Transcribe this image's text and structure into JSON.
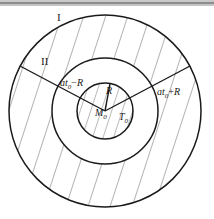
{
  "figure": {
    "name": "concentric-circles-hatched-diagram",
    "type": "geometric-diagram",
    "background_color": "#ffffff",
    "stroke_color": "#1a1a1a",
    "hatch_color": "#555555",
    "scan_artifact_color": "#9a9a9a"
  },
  "geometry": {
    "center": {
      "x": 105,
      "y": 111,
      "label_point": "M0"
    },
    "circles": [
      {
        "name": "outer-circle",
        "radius": 96,
        "stroke_width": 1.4,
        "fill": "none"
      },
      {
        "name": "middle-circle",
        "radius": 53,
        "stroke_width": 1.4,
        "fill": "none"
      },
      {
        "name": "inner-circle",
        "radius": 28,
        "stroke_width": 1.4,
        "fill": "none"
      }
    ],
    "regions": [
      {
        "name": "outer-annulus",
        "hatch": "sparse",
        "hatch_spacing": 21,
        "hatch_angle_deg": 72
      },
      {
        "name": "middle-annulus",
        "hatch": "none",
        "fill": "white"
      },
      {
        "name": "inner-disc",
        "hatch": "dense",
        "hatch_spacing": 10,
        "hatch_angle_deg": 72
      }
    ],
    "radii_lines": [
      {
        "name": "radius-line-upper-left",
        "from": "center",
        "angle_deg": 152,
        "length": 96
      },
      {
        "name": "radius-line-upper-right",
        "from": "center",
        "angle_deg": 28,
        "length": 96
      },
      {
        "name": "radius-line-short-up",
        "from": "center",
        "angle_deg": 100,
        "length": 28
      }
    ]
  },
  "labels": {
    "region_one": {
      "text": "I",
      "x": 57,
      "y": 18
    },
    "region_two": {
      "text": "II",
      "x": 42,
      "y": 62
    },
    "radius_inner": {
      "base": "R",
      "x": 107,
      "y": 92
    },
    "center_mass": {
      "base": "M",
      "sub": "0",
      "x": 97,
      "y": 113
    },
    "time_label": {
      "base": "T",
      "sub": "0",
      "x": 120,
      "y": 117
    },
    "left_expression": {
      "base": "at",
      "sub": "0",
      "op": "−",
      "tail": "R",
      "x": 61,
      "y": 84
    },
    "right_expression": {
      "base": "at",
      "sub": "0",
      "op": "+",
      "tail": "R",
      "x": 158,
      "y": 93
    }
  },
  "scan_artifacts": [
    {
      "name": "top-scan-bar-light",
      "y": 0,
      "height": 2,
      "color": "#c9c9c9"
    },
    {
      "name": "top-scan-bar-dark",
      "y": 2,
      "height": 2,
      "color": "#8d8d8d"
    },
    {
      "name": "top-scan-bar-fade",
      "y": 4,
      "height": 2,
      "color": "#c4c4c4"
    }
  ]
}
